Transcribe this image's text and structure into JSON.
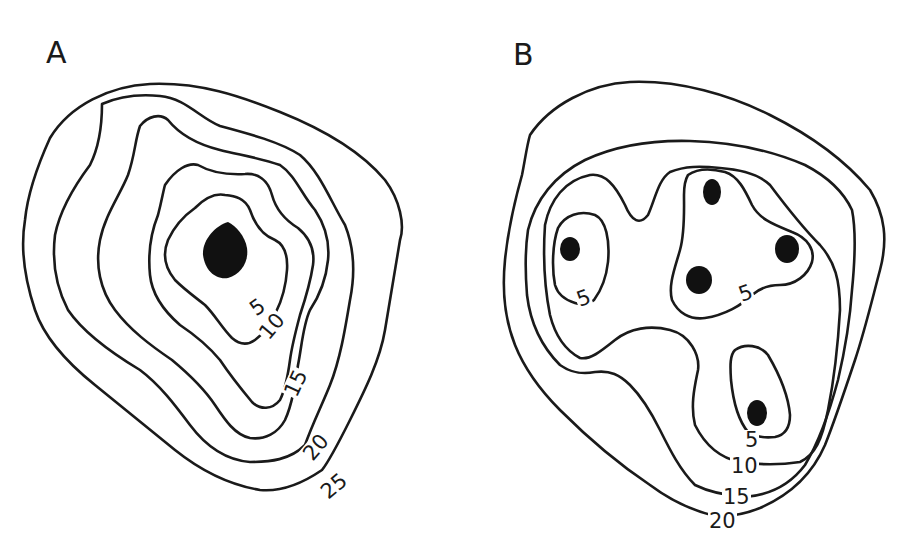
{
  "panels": [
    {
      "label": "A",
      "description": "single concentric center",
      "contour_labels": [
        "5",
        "10",
        "15",
        "20",
        "25"
      ],
      "centers": 1
    },
    {
      "label": "B",
      "description": "multiple centers",
      "contour_labels": [
        "5",
        "5",
        "5",
        "10",
        "15",
        "20"
      ],
      "centers": 5
    }
  ],
  "colors": {
    "line": "#1a1a1a",
    "fill": "#111111",
    "background": "#ffffff"
  }
}
